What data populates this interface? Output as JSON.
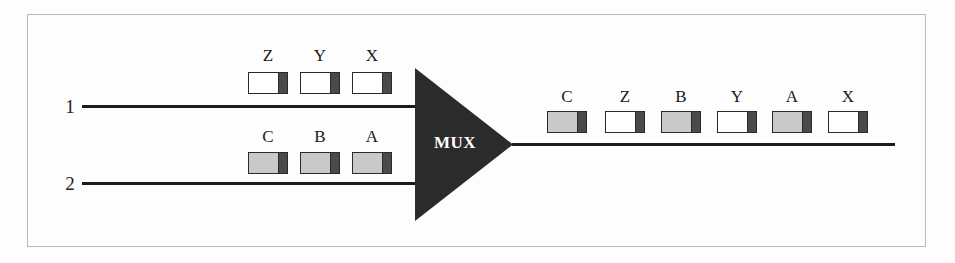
{
  "diagram": {
    "mux": {
      "label": "MUX",
      "shape": "triangle-right",
      "fill_color": "#2b2b2b",
      "text_color": "#ffffff"
    },
    "colors": {
      "wire": "#1c1c1c",
      "frame_border": "#b9b9b9",
      "packet_white": "#ffffff",
      "packet_gray": "#c9c9c9",
      "packet_header": "#4a4a4a",
      "packet_border": "#2a2a2a",
      "background": "#fdfdfd"
    },
    "inputs": [
      {
        "line_label": "1",
        "stream": "white",
        "packets": [
          {
            "label": "Z",
            "fill": "white"
          },
          {
            "label": "Y",
            "fill": "white"
          },
          {
            "label": "X",
            "fill": "white"
          }
        ]
      },
      {
        "line_label": "2",
        "stream": "gray",
        "packets": [
          {
            "label": "C",
            "fill": "gray"
          },
          {
            "label": "B",
            "fill": "gray"
          },
          {
            "label": "A",
            "fill": "gray"
          }
        ]
      }
    ],
    "output": {
      "packets": [
        {
          "label": "C",
          "fill": "gray"
        },
        {
          "label": "Z",
          "fill": "white"
        },
        {
          "label": "B",
          "fill": "gray"
        },
        {
          "label": "Y",
          "fill": "white"
        },
        {
          "label": "A",
          "fill": "gray"
        },
        {
          "label": "X",
          "fill": "white"
        }
      ]
    }
  }
}
